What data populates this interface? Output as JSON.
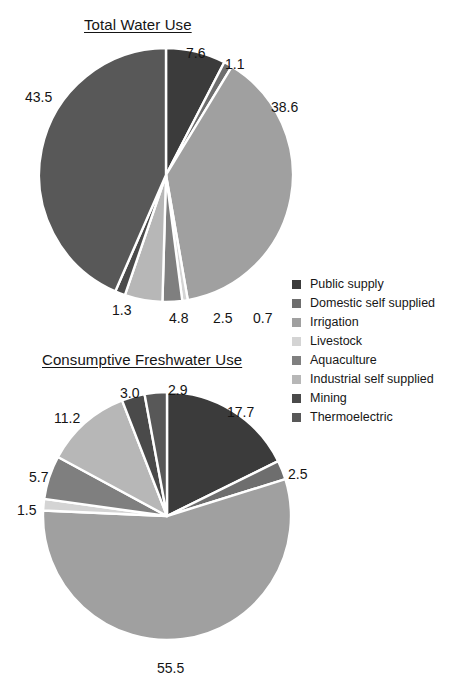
{
  "figure": {
    "background": "#ffffff",
    "width": 466,
    "height": 694
  },
  "titles": {
    "total": "Total Water Use",
    "consumptive": "Consumptive Freshwater Use"
  },
  "legend": {
    "position": "right-middle",
    "items": [
      {
        "label": "Public supply",
        "color": "#3b3b3b"
      },
      {
        "label": "Domestic self supplied",
        "color": "#6e6e6e"
      },
      {
        "label": "Irrigation",
        "color": "#a0a0a0"
      },
      {
        "label": "Livestock",
        "color": "#d4d4d4"
      },
      {
        "label": "Aquaculture",
        "color": "#7f7f7f"
      },
      {
        "label": "Industrial self supplied",
        "color": "#b7b7b7"
      },
      {
        "label": "Mining",
        "color": "#4a4a4a"
      },
      {
        "label": "Thermoelectric",
        "color": "#585858"
      }
    ]
  },
  "chart_data": [
    {
      "type": "pie",
      "title": "Total Water Use",
      "units": "percent",
      "start_angle_deg": 0,
      "direction": "clockwise",
      "categories": [
        "Public supply",
        "Domestic self supplied",
        "Irrigation",
        "Livestock",
        "Aquaculture",
        "Industrial self supplied",
        "Mining",
        "Thermoelectric"
      ],
      "values": [
        7.6,
        1.1,
        38.6,
        0.7,
        2.5,
        4.8,
        1.3,
        43.5
      ],
      "labels": [
        "7.6",
        "1.1",
        "38.6",
        "0.7",
        "2.5",
        "4.8",
        "1.3",
        "43.5"
      ],
      "colors": [
        "#3b3b3b",
        "#6e6e6e",
        "#a0a0a0",
        "#d4d4d4",
        "#7f7f7f",
        "#b7b7b7",
        "#4a4a4a",
        "#585858"
      ],
      "slice_border": "#ffffff",
      "total": 100.1
    },
    {
      "type": "pie",
      "title": "Consumptive Freshwater Use",
      "units": "percent",
      "start_angle_deg": 0,
      "direction": "clockwise",
      "categories": [
        "Public supply",
        "Domestic self supplied",
        "Irrigation",
        "Livestock",
        "Aquaculture",
        "Industrial self supplied",
        "Mining",
        "Thermoelectric"
      ],
      "values": [
        17.7,
        2.5,
        55.5,
        1.5,
        5.7,
        11.2,
        3.0,
        2.9
      ],
      "labels": [
        "17.7",
        "2.5",
        "55.5",
        "1.5",
        "5.7",
        "11.2",
        "3.0",
        "2.9"
      ],
      "colors": [
        "#3b3b3b",
        "#6e6e6e",
        "#a0a0a0",
        "#d4d4d4",
        "#7f7f7f",
        "#b7b7b7",
        "#4a4a4a",
        "#585858"
      ],
      "slice_border": "#ffffff",
      "total": 100.0
    }
  ],
  "annotations": {
    "total_water_use": {
      "public_supply": "7.6",
      "domestic_self_supplied": "1.1",
      "irrigation": "38.6",
      "livestock": "0.7",
      "aquaculture": "2.5",
      "industrial_self_supplied": "4.8",
      "mining": "1.3",
      "thermoelectric": "43.5"
    },
    "consumptive_freshwater_use": {
      "public_supply": "17.7",
      "domestic_self_supplied": "2.5",
      "irrigation": "55.5",
      "livestock": "1.5",
      "aquaculture": "5.7",
      "industrial_self_supplied": "11.2",
      "mining": "3.0",
      "thermoelectric": "2.9"
    }
  }
}
